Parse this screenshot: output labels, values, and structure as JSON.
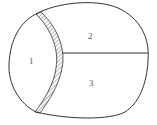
{
  "diagram": {
    "type": "sectioned-outline",
    "regions": [
      {
        "id": "1",
        "label": "1"
      },
      {
        "id": "2",
        "label": "2"
      },
      {
        "id": "3",
        "label": "3"
      }
    ],
    "features": {
      "hatched_band": "curved hatched band separating region 1 from regions 2 and 3",
      "divider": "horizontal line separating region 2 (top) from region 3 (bottom)"
    },
    "colors": {
      "stroke": "#333333",
      "text": "#555555",
      "background": "#ffffff"
    }
  }
}
